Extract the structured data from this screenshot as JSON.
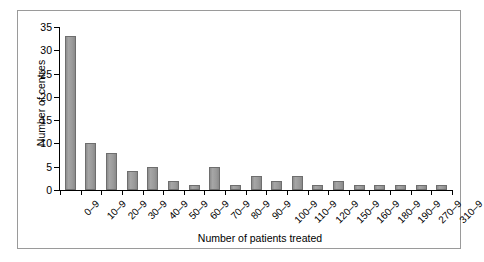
{
  "chart_data": {
    "type": "bar",
    "title": "",
    "xlabel": "Number of patients treated",
    "ylabel": "Number of centres",
    "categories": [
      "0–9",
      "10–9",
      "20–9",
      "30–9",
      "40–9",
      "50–9",
      "60–9",
      "70–9",
      "80–9",
      "90–9",
      "100–9",
      "110–9",
      "120–9",
      "150–9",
      "160–9",
      "180–9",
      "190–9",
      "270–9",
      "310–9"
    ],
    "values": [
      33,
      10,
      8,
      4,
      5,
      2,
      1,
      5,
      1,
      3,
      2,
      3,
      1,
      2,
      1,
      1,
      1,
      1,
      1
    ],
    "ylim": [
      0,
      35
    ],
    "yticks": [
      0,
      5,
      10,
      15,
      20,
      25,
      30,
      35
    ],
    "ytick_labels": [
      "0",
      "5",
      "10",
      "15",
      "20",
      "25",
      "30",
      "35"
    ],
    "grid": false,
    "legend": false,
    "bar_color": "#969696",
    "bar_edge_color": "#6e6e6e",
    "axis_color": "#000000",
    "frame_color": "#9a9a9a",
    "background": "#ffffff"
  }
}
